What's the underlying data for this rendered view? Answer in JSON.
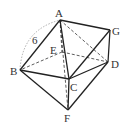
{
  "diagram": {
    "type": "polyhedron",
    "points": {
      "A": {
        "label": "A",
        "x": 60,
        "y": 20
      },
      "B": {
        "label": "B",
        "x": 20,
        "y": 70
      },
      "C": {
        "label": "C",
        "x": 69,
        "y": 79
      },
      "D": {
        "label": "D",
        "x": 108,
        "y": 62
      },
      "E": {
        "label": "E",
        "x": 62,
        "y": 52
      },
      "F": {
        "label": "F",
        "x": 68,
        "y": 110
      },
      "G": {
        "label": "G",
        "x": 110,
        "y": 30
      }
    },
    "edge_label": "6",
    "solid_edges": [
      "AB",
      "AG",
      "AC",
      "GD",
      "BC",
      "CD",
      "BF",
      "CF",
      "FD",
      "CG"
    ],
    "dashed_edges": [
      "AE",
      "EB",
      "ED",
      "AD",
      "AF"
    ]
  }
}
